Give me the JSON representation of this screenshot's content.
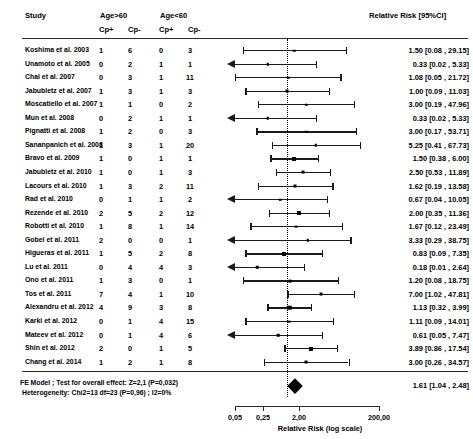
{
  "header": {
    "study_label": "Study",
    "group1_label": "Age>60",
    "group2_label": "Age<60",
    "cp_pos_label": "Cp+",
    "cp_neg_label": "Cp-",
    "rr_label": "Relative Risk [95%CI]"
  },
  "footer": {
    "model_line": "FE Model ; Test for overall effect: Z=2,1 (P=0,032)",
    "heterogeneity_line": "Heterogeneity: Chi2=13 df=23 (P=0,96) ; I2=0%",
    "summary_rr": "1.61 [1.04 , 2.48]"
  },
  "axis": {
    "title": "Relative Risk (log scale)",
    "ticks": [
      "0,05",
      "0,25",
      "2,00",
      "200,00"
    ],
    "tick_values": [
      0.05,
      0.25,
      2.0,
      200.0
    ],
    "null_value": 1.0,
    "scale": "log"
  },
  "chart_data": {
    "type": "forest",
    "title": "Relative Risk [95%CI]",
    "xlabel": "Relative Risk (log scale)",
    "ylabel": "",
    "xlim": [
      0.04,
      260
    ],
    "grid": false,
    "null_line": 1.0,
    "summary": {
      "label": "FE Model",
      "rr": 1.61,
      "ci_low": 1.04,
      "ci_high": 2.48,
      "text": "1.61 [1.04 , 2.48]",
      "z": 2.1,
      "p": 0.032,
      "chi2": 13,
      "df": 23,
      "het_p": 0.96,
      "i2": "0%"
    },
    "columns": [
      "Study",
      "Age>60 Cp+",
      "Age>60 Cp-",
      "Age<60 Cp+",
      "Age<60 Cp-",
      "Relative Risk [95%CI]"
    ],
    "rows": [
      {
        "study": "Koshima et al. 2003",
        "a": "1",
        "b": "6",
        "c": "0",
        "d": "3",
        "rr": 1.5,
        "low": 0.08,
        "high": 29.15,
        "text": "1.50 [0.08 , 29.15]",
        "weight": 1,
        "arrow_left": false
      },
      {
        "study": "Unamoto et al. 2005",
        "a": "0",
        "b": "2",
        "c": "1",
        "d": "1",
        "rr": 0.33,
        "low": 0.02,
        "high": 5.33,
        "text": "0.33 [0.02 , 5.33]",
        "weight": 1,
        "arrow_left": true
      },
      {
        "study": "Chai et al. 2007",
        "a": "0",
        "b": "3",
        "c": "1",
        "d": "11",
        "rr": 1.08,
        "low": 0.05,
        "high": 21.72,
        "text": "1.08 [0.05 , 21.72]",
        "weight": 1,
        "arrow_left": false
      },
      {
        "study": "Jabubletz et al. 2007",
        "a": "1",
        "b": "3",
        "c": "1",
        "d": "3",
        "rr": 1.0,
        "low": 0.09,
        "high": 11.03,
        "text": "1.00 [0.09 , 11.03]",
        "weight": 1.5,
        "arrow_left": false
      },
      {
        "study": "Moscatiello et al. 2007",
        "a": "1",
        "b": "1",
        "c": "0",
        "d": "2",
        "rr": 3.0,
        "low": 0.19,
        "high": 47.96,
        "text": "3.00 [0.19 , 47.96]",
        "weight": 1,
        "arrow_left": false
      },
      {
        "study": "Mun et al. 2008",
        "a": "0",
        "b": "2",
        "c": "1",
        "d": "1",
        "rr": 0.33,
        "low": 0.02,
        "high": 5.33,
        "text": "0.33 [0.02 , 5.33]",
        "weight": 1,
        "arrow_left": true
      },
      {
        "study": "Pignatti et al. 2008",
        "a": "1",
        "b": "2",
        "c": "0",
        "d": "3",
        "rr": 3.0,
        "low": 0.17,
        "high": 53.71,
        "text": "3.00 [0.17 , 53.71]",
        "weight": 1,
        "arrow_left": false
      },
      {
        "study": "Sananpanich et al. 2008",
        "a": "1",
        "b": "3",
        "c": "1",
        "d": "20",
        "rr": 5.25,
        "low": 0.41,
        "high": 67.73,
        "text": "5.25 [0.41 , 67.73]",
        "weight": 1,
        "arrow_left": false
      },
      {
        "study": "Bravo et al. 2009",
        "a": "1",
        "b": "0",
        "c": "1",
        "d": "1",
        "rr": 1.5,
        "low": 0.38,
        "high": 6.0,
        "text": "1.50 [0.38 , 6.00]",
        "weight": 2.6,
        "arrow_left": false
      },
      {
        "study": "Jabubletz et al. 2010",
        "a": "1",
        "b": "0",
        "c": "1",
        "d": "3",
        "rr": 2.5,
        "low": 0.53,
        "high": 11.89,
        "text": "2.50 [0.53 , 11.89]",
        "weight": 1.4,
        "arrow_left": false
      },
      {
        "study": "Lacours et al. 2010",
        "a": "1",
        "b": "3",
        "c": "2",
        "d": "11",
        "rr": 1.62,
        "low": 0.19,
        "high": 13.58,
        "text": "1.62 [0.19 , 13.58]",
        "weight": 1.4,
        "arrow_left": false
      },
      {
        "study": "Rad et al. 2010",
        "a": "0",
        "b": "1",
        "c": "1",
        "d": "2",
        "rr": 0.67,
        "low": 0.04,
        "high": 10.05,
        "text": "0.67 [0.04 , 10.05]",
        "weight": 1,
        "arrow_left": false
      },
      {
        "study": "Rezende et al. 2010",
        "a": "2",
        "b": "5",
        "c": "2",
        "d": "12",
        "rr": 2.0,
        "low": 0.35,
        "high": 11.36,
        "text": "2.00 [0.35 , 11.36]",
        "weight": 2.6,
        "arrow_left": false
      },
      {
        "study": "Robotti et al. 2010",
        "a": "1",
        "b": "8",
        "c": "1",
        "d": "14",
        "rr": 1.67,
        "low": 0.12,
        "high": 23.49,
        "text": "1.67 [0.12 , 23.49]",
        "weight": 1.2,
        "arrow_left": false
      },
      {
        "study": "Gobel et al. 2011",
        "a": "2",
        "b": "0",
        "c": "0",
        "d": "1",
        "rr": 3.33,
        "low": 0.29,
        "high": 38.75,
        "text": "3.33 [0.29 , 38.75]",
        "weight": 1,
        "arrow_left": true
      },
      {
        "study": "Higueras et al. 2011",
        "a": "1",
        "b": "5",
        "c": "2",
        "d": "8",
        "rr": 0.83,
        "low": 0.09,
        "high": 7.35,
        "text": "0.83 [0.09 , 7.35]",
        "weight": 2.6,
        "arrow_left": false
      },
      {
        "study": "Lu et al. 2011",
        "a": "0",
        "b": "4",
        "c": "4",
        "d": "3",
        "rr": 0.18,
        "low": 0.01,
        "high": 2.64,
        "text": "0.18 [0.01 , 2.64]",
        "weight": 1,
        "arrow_left": false
      },
      {
        "study": "Ono et al. 2011",
        "a": "1",
        "b": "3",
        "c": "0",
        "d": "1",
        "rr": 1.2,
        "low": 0.08,
        "high": 18.75,
        "text": "1.20 [0.08 , 18.75]",
        "weight": 1.2,
        "arrow_left": false
      },
      {
        "study": "Tos et al. 2011",
        "a": "7",
        "b": "4",
        "c": "1",
        "d": "10",
        "rr": 7.0,
        "low": 1.02,
        "high": 47.81,
        "text": "7.00 [1.02 , 47.81]",
        "weight": 1.4,
        "arrow_left": false
      },
      {
        "study": "Alexandru et al. 2012",
        "a": "4",
        "b": "9",
        "c": "3",
        "d": "8",
        "rr": 1.13,
        "low": 0.32,
        "high": 3.99,
        "text": "1.13 [0.32 , 3.99]",
        "weight": 3.4,
        "arrow_left": false
      },
      {
        "study": "Karki et al. 2012",
        "a": "0",
        "b": "1",
        "c": "4",
        "d": "15",
        "rr": 1.11,
        "low": 0.09,
        "high": 14.01,
        "text": "1.11 [0.09 , 14.01]",
        "weight": 1.2,
        "arrow_left": false
      },
      {
        "study": "Mateev et al. 2012",
        "a": "0",
        "b": "1",
        "c": "4",
        "d": "6",
        "rr": 0.61,
        "low": 0.05,
        "high": 7.47,
        "text": "0.61 [0.05 , 7.47]",
        "weight": 1,
        "arrow_left": true
      },
      {
        "study": "Shin et al. 2012",
        "a": "2",
        "b": "0",
        "c": "1",
        "d": "5",
        "rr": 3.89,
        "low": 0.86,
        "high": 17.54,
        "text": "3.89 [0.86 , 17.54]",
        "weight": 2.8,
        "arrow_left": false
      },
      {
        "study": "Chang et al. 2014",
        "a": "1",
        "b": "2",
        "c": "1",
        "d": "8",
        "rr": 3.0,
        "low": 0.26,
        "high": 34.57,
        "text": "3.00 [0.26 , 34.57]",
        "weight": 1.4,
        "arrow_left": false
      }
    ]
  }
}
